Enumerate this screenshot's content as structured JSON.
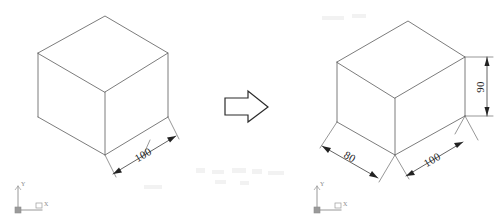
{
  "scene": {
    "title": "Isometric box extrusion comparison",
    "background_color": "#ffffff",
    "edge_color": "#5a5a5a",
    "dimension_color": "#1c1c1c",
    "arrow_symbol_color": "#2b2b2b"
  },
  "left_panel": {
    "name": "original-cube",
    "shape_label": "isometric-cube",
    "dimensions": [
      {
        "id": "left-width",
        "value": "100",
        "orientation": "along-bottom-right-edge",
        "rotation_deg": -27
      }
    ],
    "ucs": {
      "x_label": "X",
      "y_label": "Y",
      "origin_label": ""
    }
  },
  "transform_arrow": {
    "name": "right-arrow",
    "label": "transforms-to",
    "direction": "right"
  },
  "right_panel": {
    "name": "modified-box",
    "shape_label": "isometric-box",
    "dimensions": [
      {
        "id": "right-depth",
        "value": "80",
        "orientation": "along-bottom-left-edge",
        "rotation_deg": 27
      },
      {
        "id": "right-width",
        "value": "100",
        "orientation": "along-bottom-right-edge",
        "rotation_deg": -27
      },
      {
        "id": "right-height",
        "value": "90",
        "orientation": "vertical-right-side",
        "rotation_deg": -90
      }
    ],
    "ucs": {
      "x_label": "X",
      "y_label": "Y",
      "origin_label": ""
    }
  }
}
